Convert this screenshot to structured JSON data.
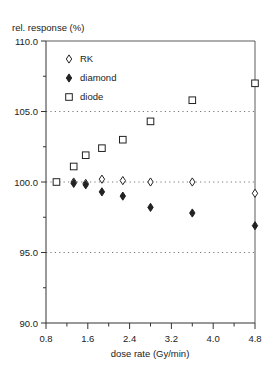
{
  "chart_data": {
    "type": "scatter",
    "title": "",
    "ylabel": "rel. response (%)",
    "xlabel": "dose rate (Gy/min)",
    "xlim": [
      0.8,
      4.8
    ],
    "ylim": [
      90.0,
      110.0
    ],
    "xticks": [
      0.8,
      1.6,
      2.4,
      3.2,
      4.0,
      4.8
    ],
    "xtick_labels": [
      "0.8",
      "1.6",
      "2.4",
      "3.2",
      "4.0",
      "4.8"
    ],
    "yticks": [
      90.0,
      95.0,
      100.0,
      105.0,
      110.0
    ],
    "ytick_labels": [
      "90.0",
      "95.0",
      "100.0",
      "105.0",
      "110.0"
    ],
    "grid": {
      "horizontal_dotted_at": [
        95.0,
        100.0,
        105.0
      ]
    },
    "legend": {
      "position": "upper-left inside",
      "entries": [
        "RK",
        "diamond",
        "diode"
      ]
    },
    "series": [
      {
        "name": "RK",
        "marker": "open-diamond",
        "x": [
          1.33,
          1.56,
          1.87,
          2.27,
          2.8,
          3.6,
          4.8
        ],
        "y": [
          100.0,
          99.9,
          100.2,
          100.1,
          100.0,
          100.0,
          99.2
        ]
      },
      {
        "name": "diamond",
        "marker": "filled-diamond",
        "x": [
          1.33,
          1.56,
          1.87,
          2.27,
          2.8,
          3.6,
          4.8
        ],
        "y": [
          99.9,
          99.8,
          99.3,
          99.0,
          98.2,
          97.8,
          96.9
        ]
      },
      {
        "name": "diode",
        "marker": "open-square",
        "x": [
          1.0,
          1.33,
          1.56,
          1.87,
          2.27,
          2.8,
          3.6,
          4.8
        ],
        "y": [
          100.0,
          101.1,
          101.9,
          102.4,
          103.0,
          104.3,
          105.8,
          107.0
        ]
      }
    ]
  },
  "colors": {
    "axis": "#333333",
    "marker": "#222222",
    "grid": "#555555",
    "background": "#ffffff"
  }
}
